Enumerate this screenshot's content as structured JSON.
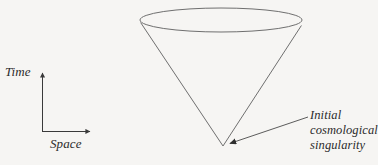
{
  "figure": {
    "name": "initial-cosmological-singularity-light-cone",
    "background_color": "#f6f5f3",
    "stroke_color": "#6f6f6f",
    "text_color": "#2b2b2b"
  },
  "axes": {
    "vertical": {
      "label": "Time",
      "arrow": "up-arrow-icon"
    },
    "horizontal": {
      "label": "Space",
      "arrow": "right-arrow-icon"
    }
  },
  "cone": {
    "name": "light-cone",
    "ellipse": {
      "center_x": 221,
      "center_y": 20,
      "radius_x": 81,
      "radius_y": 12
    },
    "apex": {
      "x": 223,
      "y": 146
    }
  },
  "annotation": {
    "name": "singularity-annotation",
    "lines": [
      "Initial",
      "cosmological",
      "singularity"
    ],
    "leader": {
      "from_x": 308,
      "from_y": 117,
      "to_x": 226,
      "to_y": 145,
      "arrow": "arrowhead-icon"
    }
  }
}
